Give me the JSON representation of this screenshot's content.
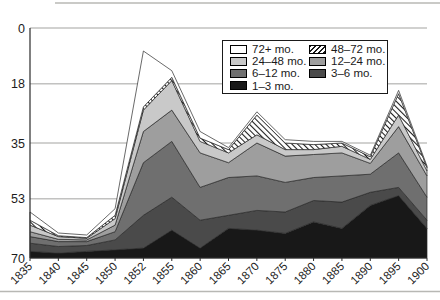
{
  "page": {
    "background": "#ffffff",
    "rule_color": "#b8b8b4"
  },
  "axes": {
    "y_tick_labels": [
      "70",
      "53",
      "35",
      "18",
      "0"
    ],
    "x_tick_labels": [
      "1835",
      "1840",
      "1845",
      "1850",
      "1852",
      "1855",
      "1860",
      "1865",
      "1870",
      "1875",
      "1880",
      "1885",
      "1890",
      "1895",
      "1900"
    ],
    "axis_color": "#2b2b2b",
    "grid_color": "#a3a3a0",
    "label_color": "#1c1c1c"
  },
  "legend": {
    "items": [
      {
        "label": "72+ mo.",
        "swatch": "#ffffff"
      },
      {
        "label": "48–72 mo.",
        "swatch": "hatch"
      },
      {
        "label": "24–48 mo.",
        "swatch": "#c9c9c9"
      },
      {
        "label": "12–24 mo.",
        "swatch": "#9e9e9e"
      },
      {
        "label": "6–12 mo.",
        "swatch": "#6f6f6f"
      },
      {
        "label": "3–6 mo.",
        "swatch": "#4a4a4a"
      },
      {
        "label": "1–3 mo.",
        "swatch": "#181818"
      }
    ]
  },
  "chart_data": {
    "type": "area",
    "stacked": true,
    "title": "",
    "xlabel": "",
    "ylabel": "",
    "x": [
      1835,
      1840,
      1845,
      1850,
      1852,
      1855,
      1860,
      1865,
      1870,
      1875,
      1880,
      1885,
      1890,
      1895,
      1900
    ],
    "ylim": [
      0,
      70
    ],
    "yticks": [
      0,
      18,
      35,
      53,
      70
    ],
    "grid": true,
    "legend_position": "top-right",
    "series": [
      {
        "name": "1–3 mo.",
        "color": "#181818",
        "values": [
          2,
          1.5,
          2,
          2.5,
          3,
          8.5,
          3,
          9,
          8.5,
          7.5,
          11,
          9,
          16,
          19,
          9
        ]
      },
      {
        "name": "3–6 mo.",
        "color": "#4a4a4a",
        "values": [
          2.5,
          2,
          1.8,
          3,
          10,
          10,
          8.5,
          4,
          6,
          6.5,
          6.5,
          8,
          4,
          2.5,
          2.5
        ]
      },
      {
        "name": "6–12 mo.",
        "color": "#6f6f6f",
        "values": [
          2,
          1.5,
          1.2,
          2.5,
          16,
          17,
          10,
          11.5,
          10.5,
          9,
          7,
          8,
          5.5,
          10.5,
          7
        ]
      },
      {
        "name": "12–24 mo.",
        "color": "#9e9e9e",
        "values": [
          1.5,
          0.7,
          0.5,
          2,
          9.5,
          9.5,
          10.5,
          4.5,
          10,
          8,
          7,
          7,
          3.3,
          8,
          6.5
        ]
      },
      {
        "name": "24–48 mo.",
        "color": "#c9c9c9",
        "values": [
          2,
          0.8,
          0.5,
          2,
          6.5,
          9,
          3.5,
          3,
          2.5,
          2,
          1.5,
          2,
          1.2,
          3.5,
          1.5
        ]
      },
      {
        "name": "48–72 mo.",
        "color": "hatch",
        "values": [
          1.5,
          0.3,
          0.2,
          1,
          1,
          1,
          1,
          1,
          6,
          2,
          1.5,
          1,
          0.8,
          6.5,
          1
        ]
      },
      {
        "name": "72+ mo.",
        "color": "#ffffff",
        "values": [
          2.5,
          0.8,
          0.8,
          2,
          17,
          2,
          2,
          0.6,
          1,
          1,
          1,
          0.5,
          0.5,
          1,
          0.5
        ]
      }
    ]
  }
}
